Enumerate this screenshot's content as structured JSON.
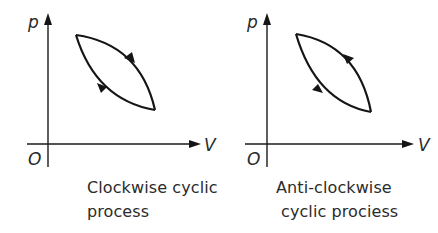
{
  "diagrams": [
    {
      "id": "clockwise",
      "axes": {
        "y_label": "p",
        "x_label": "V",
        "origin_label": "O"
      },
      "caption": {
        "line1": "Clockwise cyclic",
        "line2": "process"
      },
      "direction": "clockwise"
    },
    {
      "id": "anticlockwise",
      "axes": {
        "y_label": "p",
        "x_label": "V",
        "origin_label": "O"
      },
      "caption": {
        "line1": "Anti-clockwise",
        "line2": "cyclic prociess"
      },
      "direction": "anti-clockwise"
    }
  ],
  "colors": {
    "line": "#151515",
    "text": "#2b2b2b",
    "background": "#ffffff"
  }
}
